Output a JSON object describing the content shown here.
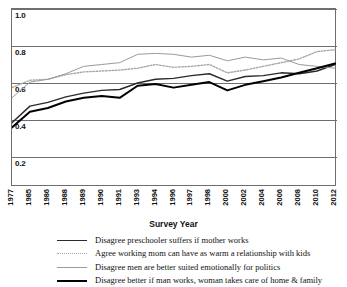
{
  "chart_data": {
    "type": "line",
    "title": "",
    "xlabel": "Survey Year",
    "ylabel": "",
    "ylim": [
      0.0,
      1.0
    ],
    "ytick_labels": [
      "1.0",
      "0.8",
      "0.6",
      "0.4",
      "0.2"
    ],
    "ytick_values": [
      1.0,
      0.8,
      0.6,
      0.4,
      0.2
    ],
    "grid": true,
    "legend_position": "bottom",
    "categories": [
      1977,
      1985,
      1986,
      1988,
      1989,
      1990,
      1991,
      1993,
      1994,
      1996,
      1997,
      1998,
      2000,
      2002,
      2004,
      2006,
      2008,
      2010,
      2012
    ],
    "xtick_labels": [
      "1977",
      "1985",
      "1986",
      "1988",
      "1989",
      "1990",
      "1991",
      "1993",
      "1994",
      "1996",
      "1997",
      "1998",
      "2000",
      "2002",
      "2004",
      "2006",
      "2008",
      "2010",
      "2012"
    ],
    "series": [
      {
        "name": "Disagree preschooler suffers if mother works",
        "style": "solid",
        "color": "#2b2b2b",
        "width": 1.4,
        "values": [
          0.385,
          0.475,
          0.495,
          0.525,
          0.545,
          0.56,
          0.565,
          0.6,
          0.62,
          0.625,
          0.64,
          0.65,
          0.61,
          0.635,
          0.64,
          0.655,
          0.65,
          0.665,
          0.7
        ]
      },
      {
        "name": "Agree working mom can have as warm a relationship with kids",
        "style": "dotted",
        "color": "#a8a8a8",
        "width": 1.4,
        "values": [
          0.575,
          0.615,
          0.62,
          0.645,
          0.66,
          0.665,
          0.67,
          0.68,
          0.7,
          0.685,
          0.69,
          0.7,
          0.655,
          0.67,
          0.69,
          0.71,
          0.73,
          0.77,
          0.78
        ]
      },
      {
        "name": "Disagree men are better suited emotionally for politics",
        "style": "solid",
        "color": "#9a9a9a",
        "width": 1.0,
        "values": [
          0.52,
          0.605,
          0.62,
          0.65,
          0.69,
          0.7,
          0.71,
          0.755,
          0.76,
          0.755,
          0.74,
          0.75,
          0.72,
          0.74,
          0.725,
          0.735,
          0.7,
          0.69,
          0.68
        ]
      },
      {
        "name": "Disagree better if man works, woman takes care of home & family",
        "style": "solid",
        "color": "#000000",
        "width": 2.0,
        "values": [
          0.36,
          0.445,
          0.465,
          0.5,
          0.52,
          0.53,
          0.52,
          0.585,
          0.595,
          0.575,
          0.59,
          0.605,
          0.56,
          0.59,
          0.61,
          0.63,
          0.655,
          0.68,
          0.705
        ]
      }
    ]
  },
  "legend": {
    "items": [
      {
        "label": "Disagree preschooler suffers if mother works",
        "key": "k-solid-med"
      },
      {
        "label": "Agree working mom can have as warm a relationship with kids",
        "key": "k-dotted"
      },
      {
        "label": "Disagree men are better suited emotionally for politics",
        "key": "k-thin-gray"
      },
      {
        "label": "Disagree better if man works, woman takes care of home & family",
        "key": "k-thick-black"
      }
    ]
  }
}
